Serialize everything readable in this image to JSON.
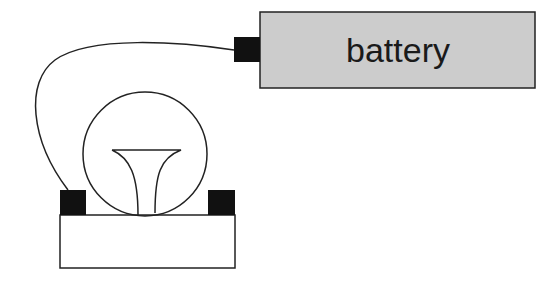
{
  "diagram": {
    "battery": {
      "label": "battery",
      "fill": "#cccccc"
    },
    "terminal_color": "#111111",
    "stroke_color": "#222222"
  }
}
